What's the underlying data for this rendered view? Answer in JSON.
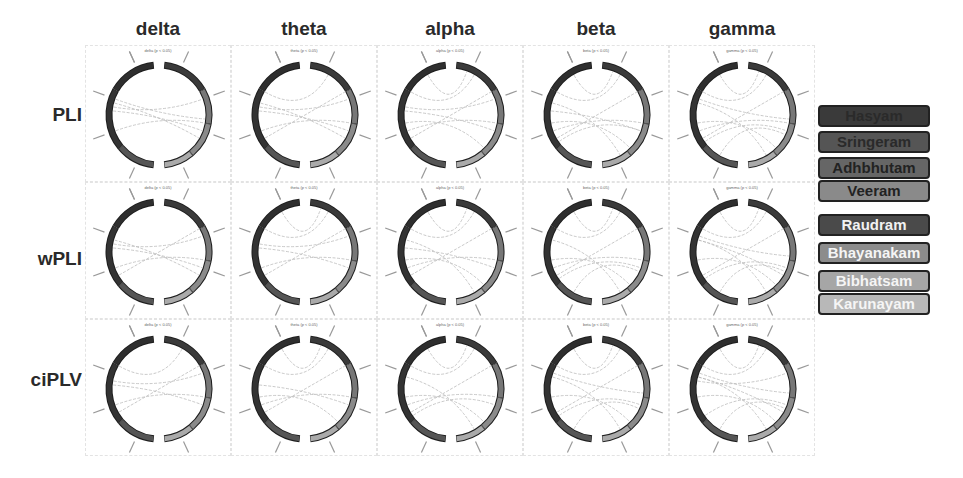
{
  "columns": [
    "delta",
    "theta",
    "alpha",
    "beta",
    "gamma"
  ],
  "rows": [
    "PLI",
    "wPLI",
    "ciPLV"
  ],
  "subtitles": [
    [
      "delta (p < 0.05)",
      "theta (p < 0.05)",
      "alpha (p < 0.05)",
      "beta (p < 0.05)",
      "gamma (p < 0.05)"
    ],
    [
      "delta (p < 0.05)",
      "theta (p < 0.05)",
      "alpha (p < 0.05)",
      "beta (p < 0.05)",
      "gamma (p < 0.05)"
    ],
    [
      "delta (p < 0.05)",
      "theta (p < 0.05)",
      "alpha (p < 0.05)",
      "beta (p < 0.05)",
      "gamma (p < 0.05)"
    ]
  ],
  "legend_group1": [
    {
      "label": "Hasyam",
      "bg": "#3a3a3a",
      "fg": "#2a2a2a"
    },
    {
      "label": "Sringeram",
      "bg": "#555555",
      "fg": "#2a2a2a"
    },
    {
      "label": "Adhbhutam",
      "bg": "#666666",
      "fg": "#222222"
    },
    {
      "label": "Veeram",
      "bg": "#8a8a8a",
      "fg": "#222222"
    }
  ],
  "legend_group2": [
    {
      "label": "Raudram",
      "bg": "#4a4a4a",
      "fg": "#f2f2f2"
    },
    {
      "label": "Bhayanakam",
      "bg": "#8c8c8c",
      "fg": "#f5f5f5"
    },
    {
      "label": "Bibhatsam",
      "bg": "#a6a6a6",
      "fg": "#f5f5f5"
    },
    {
      "label": "Karunayam",
      "bg": "#b8b8b8",
      "fg": "#f5f5f5"
    }
  ],
  "chart_data": {
    "type": "chord-grid",
    "title": "",
    "columns": [
      "delta",
      "theta",
      "alpha",
      "beta",
      "gamma"
    ],
    "rows": [
      "PLI",
      "wPLI",
      "ciPLV"
    ],
    "threshold": "p < 0.05",
    "nodes": [
      "Hasyam",
      "Sringeram",
      "Adhbhutam",
      "Veeram",
      "Raudram",
      "Bhayanakam",
      "Bibhatsam",
      "Karunayam"
    ]
  }
}
